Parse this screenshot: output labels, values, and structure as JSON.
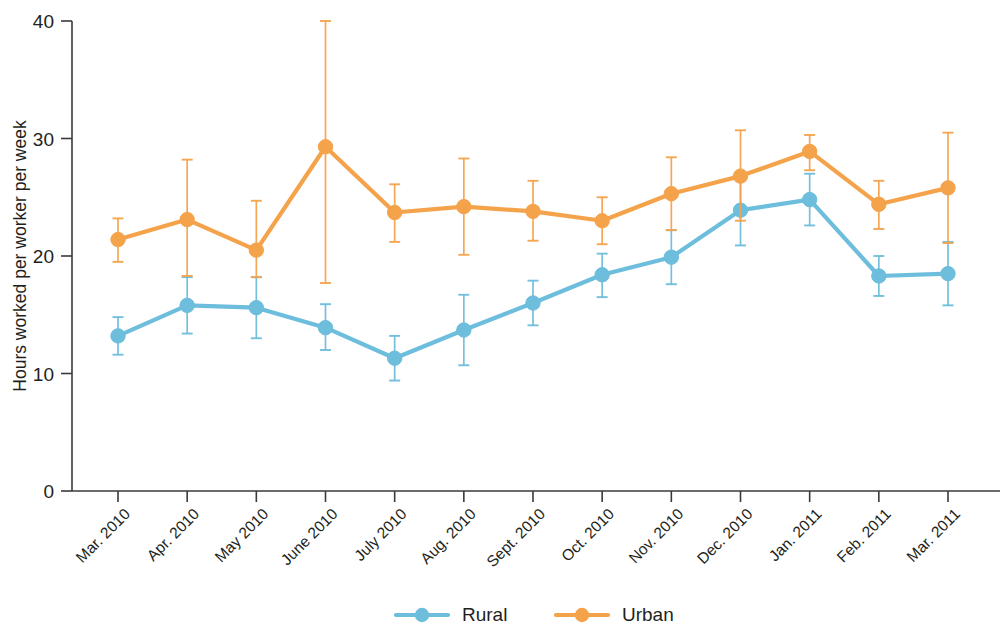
{
  "chart_data": {
    "type": "line",
    "title": "",
    "xlabel": "",
    "ylabel": "Hours worked per worker per week",
    "ylim": [
      0,
      40
    ],
    "yticks": [
      0,
      10,
      20,
      30,
      40
    ],
    "grid": false,
    "legend_position": "bottom-center",
    "error_bars": true,
    "categories": [
      "Mar. 2010",
      "Apr. 2010",
      "May 2010",
      "June 2010",
      "July 2010",
      "Aug. 2010",
      "Sept. 2010",
      "Oct. 2010",
      "Nov. 2010",
      "Dec. 2010",
      "Jan. 2011",
      "Feb. 2011",
      "Mar. 2011"
    ],
    "series": [
      {
        "name": "Rural",
        "color": "#6DBDDC",
        "values": [
          13.2,
          15.8,
          15.6,
          13.9,
          11.3,
          13.7,
          16.0,
          18.4,
          19.9,
          23.9,
          24.8,
          18.3,
          18.5
        ],
        "err_low": [
          11.6,
          13.4,
          13.0,
          12.0,
          9.4,
          10.7,
          14.1,
          16.5,
          17.6,
          20.9,
          22.6,
          16.6,
          15.8
        ],
        "err_high": [
          14.8,
          18.2,
          18.2,
          15.9,
          13.2,
          16.7,
          17.9,
          20.2,
          22.2,
          26.9,
          27.0,
          20.0,
          21.2
        ]
      },
      {
        "name": "Urban",
        "color": "#F5A34B",
        "values": [
          21.4,
          23.1,
          20.5,
          29.3,
          23.7,
          24.2,
          23.8,
          23.0,
          25.3,
          26.8,
          28.9,
          24.4,
          25.8
        ],
        "err_low": [
          19.5,
          18.3,
          18.2,
          17.7,
          21.2,
          20.1,
          21.3,
          21.0,
          22.2,
          23.0,
          27.3,
          22.3,
          21.1
        ],
        "err_high": [
          23.2,
          28.2,
          24.7,
          40.0,
          26.1,
          28.3,
          26.4,
          25.0,
          28.4,
          30.7,
          30.3,
          26.4,
          30.5
        ]
      }
    ]
  },
  "legend": {
    "items": [
      {
        "label": "Rural",
        "color": "#6DBDDC"
      },
      {
        "label": "Urban",
        "color": "#F5A34B"
      }
    ]
  },
  "axes": {
    "y_title": "Hours worked per worker per week",
    "y_tick_labels": [
      "0",
      "10",
      "20",
      "30",
      "40"
    ]
  }
}
